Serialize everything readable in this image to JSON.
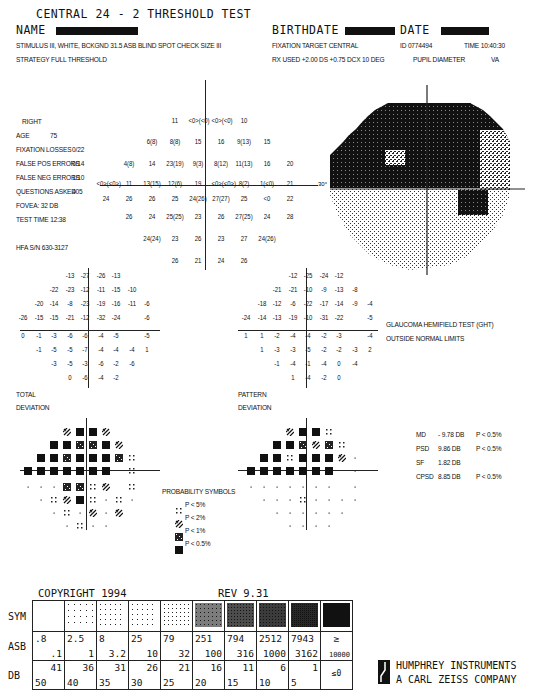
{
  "header": {
    "title": "CENTRAL 24 - 2 THRESHOLD TEST",
    "name_label": "NAME",
    "birthdate_label": "BIRTHDATE",
    "date_label": "DATE",
    "stimulus": "STIMULUS  III, WHITE, BCKGND 31.5 ASB  BLIND SPOT CHECK SIZE  III",
    "strategy": "STRATEGY   FULL THRESHOLD",
    "fixation_target": "FIXATION TARGET    CENTRAL",
    "id": "ID  0774494",
    "time": "TIME  10:40:30",
    "rx_used": "RX USED +2.00 DS +0.75 DCX 10 DEG",
    "pupil_diameter": "PUPIL DIAMETER",
    "va": "VA"
  },
  "patient": {
    "eye": "RIGHT",
    "age_label": "AGE",
    "age": "75",
    "fixation_losses_label": "FIXATION LOSSES",
    "fixation_losses": "0/22",
    "false_pos_label": "FALSE POS ERRORS",
    "false_pos": "0/14",
    "false_neg_label": "FALSE NEG ERRORS",
    "false_neg": "1/10",
    "questions_label": "QUESTIONS ASKED",
    "questions": "405",
    "fovea": "FOVEA:  32 DB",
    "test_time": "TEST TIME 12:38",
    "hfa_sn": "HFA S/N   630-3127"
  },
  "threshold_values": {
    "rows": [
      [
        "11",
        "<0>(<0)",
        "<0>(<0)",
        "10"
      ],
      [
        "6(8)",
        "8(8)",
        "15",
        "16",
        "9(13)",
        "15"
      ],
      [
        "4(8)",
        "14",
        "23(19)",
        "9(3)",
        "8(12)",
        "11(13)",
        "16",
        "20"
      ],
      [
        "<0>(<0>)",
        "11",
        "13(15)",
        "12(6)",
        "19",
        "<0>(<0>)",
        "8(2)",
        "1(<0)",
        "21"
      ],
      [
        "24",
        "26",
        "26",
        "25",
        "24(26)",
        "27(27)",
        "25",
        "<0",
        "22"
      ],
      [
        "26",
        "24",
        "25(25)",
        "23",
        "26",
        "27(25)",
        "24",
        "28"
      ],
      [
        "24(24)",
        "23",
        "26",
        "23",
        "27",
        "24(26)"
      ],
      [
        "26",
        "21",
        "24",
        "26"
      ]
    ]
  },
  "greyscale": {
    "degree_label": "30°"
  },
  "total_deviation": {
    "label1": "TOTAL",
    "label2": "DEVIATION",
    "rows": [
      [
        "-13",
        "-27",
        "-26",
        "-13"
      ],
      [
        "-22",
        "-23",
        "-12",
        "-11",
        "-15",
        "-10"
      ],
      [
        "-20",
        "-14",
        "-8",
        "-23",
        "-19",
        "-16",
        "-11",
        "-6"
      ],
      [
        "-26",
        "-15",
        "-15",
        "-21",
        "-12",
        "-32",
        "-24",
        "",
        "-6"
      ],
      [
        "0",
        "-1",
        "-3",
        "-6",
        "-6",
        "-4",
        "-5",
        "",
        "-5"
      ],
      [
        "-1",
        "-5",
        "-5",
        "-7",
        "-4",
        "-4",
        "-4",
        "1"
      ],
      [
        "-3",
        "-5",
        "-3",
        "-6",
        "-2",
        "-6"
      ],
      [
        "0",
        "-6",
        "-4",
        "-2"
      ]
    ]
  },
  "pattern_deviation": {
    "label1": "PATTERN",
    "label2": "DEVIATION",
    "rows": [
      [
        "-12",
        "-25",
        "-24",
        "-12"
      ],
      [
        "-21",
        "-21",
        "-10",
        "-9",
        "-13",
        "-8"
      ],
      [
        "-18",
        "-12",
        "-6",
        "-22",
        "-17",
        "-14",
        "-9",
        "-4"
      ],
      [
        "-24",
        "-14",
        "-13",
        "-19",
        "-10",
        "-31",
        "-22",
        "",
        "-5"
      ],
      [
        "1",
        "1",
        "-2",
        "-4",
        "-4",
        "-2",
        "-3",
        "",
        "-4"
      ],
      [
        "1",
        "-3",
        "-3",
        "-5",
        "-2",
        "-2",
        "-3",
        "2"
      ],
      [
        "-1",
        "-4",
        "-1",
        "-4",
        "0",
        "-4"
      ],
      [
        "1",
        "-4",
        "-2",
        "0"
      ]
    ]
  },
  "ght": {
    "title": "GLAUCOMA HEMIFIELD TEST (GHT)",
    "result": "OUTSIDE NORMAL LIMITS"
  },
  "global_indices": [
    {
      "label": "MD",
      "value": "- 9.78 DB",
      "p": "P < 0.5%"
    },
    {
      "label": "PSD",
      "value": "9.86 DB",
      "p": "P < 0.5%"
    },
    {
      "label": "SF",
      "value": "1.82 DB",
      "p": ""
    },
    {
      "label": "CPSD",
      "value": "8.85 DB",
      "p": "P < 0.5%"
    }
  ],
  "probability_symbols": {
    "title": "PROBABILITY SYMBOLS",
    "items": [
      {
        "symbol": "p5",
        "label": "P <  5%"
      },
      {
        "symbol": "p2",
        "label": "P <  2%"
      },
      {
        "symbol": "p1",
        "label": "P <  1%"
      },
      {
        "symbol": "p05",
        "label": "P < 0.5%"
      }
    ]
  },
  "td_prob_rows": [
    [
      "p2",
      "p05",
      "p05",
      "p2"
    ],
    [
      "p05",
      "p05",
      "p1",
      "p1",
      "p05",
      "p2"
    ],
    [
      "p05",
      "p05",
      "p1",
      "p05",
      "p05",
      "p05",
      "p1",
      "p5"
    ],
    [
      "p05",
      "p05",
      "p05",
      "p05",
      "p05",
      "p05",
      "p05",
      "",
      "p5"
    ],
    [
      "n",
      "n",
      "n",
      "p1",
      "p1",
      "p5",
      "p2",
      "",
      "p5"
    ],
    [
      "n",
      "p5",
      "p2",
      "p05",
      "p5",
      "n",
      "p5",
      "n"
    ],
    [
      "n",
      "p5",
      "n",
      "p2",
      "n",
      "p2"
    ],
    [
      "n",
      "p5",
      "n",
      "n"
    ]
  ],
  "pd_prob_rows": [
    [
      "p2",
      "p05",
      "p05",
      "p5"
    ],
    [
      "p05",
      "p05",
      "p1",
      "p2",
      "p1",
      "p5"
    ],
    [
      "p05",
      "p05",
      "p5",
      "p05",
      "p05",
      "p05",
      "p2",
      "n"
    ],
    [
      "p05",
      "p05",
      "p05",
      "p05",
      "p05",
      "p05",
      "p05",
      "",
      "n"
    ],
    [
      "n",
      "n",
      "n",
      "n",
      "n",
      "n",
      "n",
      "",
      "n"
    ],
    [
      "n",
      "n",
      "n",
      "p5",
      "n",
      "n",
      "n",
      "n"
    ],
    [
      "n",
      "n",
      "n",
      "n",
      "n",
      "n"
    ],
    [
      "n",
      "n",
      "n",
      "n"
    ]
  ],
  "footer": {
    "copyright": "COPYRIGHT 1994",
    "rev": "REV 9.31",
    "sym_label": "SYM",
    "asb_label": "ASB",
    "db_label": "DB",
    "asb": [
      [
        ".8",
        ".1"
      ],
      [
        "2.5",
        "1"
      ],
      [
        "8",
        "3.2"
      ],
      [
        "25",
        "10"
      ],
      [
        "79",
        "32"
      ],
      [
        "251",
        "100"
      ],
      [
        "794",
        "316"
      ],
      [
        "2512",
        "1000"
      ],
      [
        "7943",
        "3162"
      ],
      [
        "≥",
        "10000"
      ]
    ],
    "db": [
      [
        "41",
        "50"
      ],
      [
        "36",
        "40"
      ],
      [
        "31",
        "35"
      ],
      [
        "26",
        "30"
      ],
      [
        "21",
        "25"
      ],
      [
        "16",
        "20"
      ],
      [
        "11",
        "15"
      ],
      [
        "6",
        "10"
      ],
      [
        "1",
        "5"
      ],
      [
        "≤0",
        ""
      ]
    ],
    "company1": "HUMPHREY INSTRUMENTS",
    "company2": "A CARL ZEISS COMPANY"
  }
}
